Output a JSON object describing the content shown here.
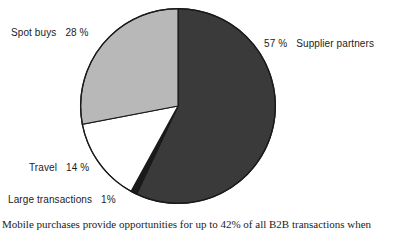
{
  "chart_data": {
    "type": "pie",
    "title": "",
    "subtitle": "",
    "xlabel": "",
    "ylabel": "",
    "legend_position": "none",
    "grid": false,
    "label_format": "name + percent",
    "start_angle_deg": 0,
    "direction": "clockwise",
    "categories": [
      "Supplier partners",
      "Large transactions",
      "Travel",
      "Spot buys"
    ],
    "values": [
      57,
      1,
      14,
      28
    ],
    "unit": "%",
    "slices": [
      {
        "name": "Supplier partners",
        "value": 57,
        "value_text": "57 %",
        "color": "#3a3a3a",
        "start_deg": 0,
        "end_deg": 205.2,
        "label_side": "right"
      },
      {
        "name": "Large transactions",
        "value": 1,
        "value_text": "1%",
        "color": "#1a1a1a",
        "start_deg": 205.2,
        "end_deg": 208.8,
        "label_side": "left"
      },
      {
        "name": "Travel",
        "value": 14,
        "value_text": "14 %",
        "color": "#ffffff",
        "start_deg": 208.8,
        "end_deg": 259.2,
        "label_side": "left"
      },
      {
        "name": "Spot buys",
        "value": 28,
        "value_text": "28 %",
        "color": "#b8b8b8",
        "start_deg": 259.2,
        "end_deg": 360,
        "label_side": "left"
      }
    ],
    "outline_color": "#1a1a1a",
    "background_color": "#ffffff"
  },
  "labels": {
    "spot_buys": {
      "name": "Spot buys",
      "value": "28 %"
    },
    "supplier_partners": {
      "name": "Supplier partners",
      "value": "57 %"
    },
    "travel": {
      "name": "Travel",
      "value": "14 %"
    },
    "large_transactions": {
      "name": "Large transactions",
      "value": "1%"
    }
  },
  "caption": {
    "text": "Mobile purchases provide opportunities for up to 42% of all B2B transactions when"
  }
}
